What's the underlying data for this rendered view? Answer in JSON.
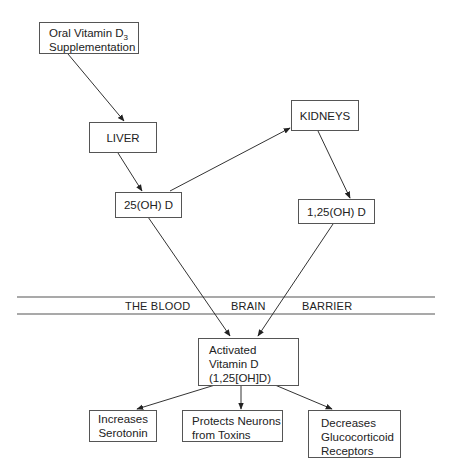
{
  "nodes": {
    "oral": {
      "line1": "Oral Vitamin D",
      "sub": "3",
      "line2": "Supplementation"
    },
    "liver": {
      "label": "LIVER"
    },
    "kidneys": {
      "label": "KIDNEYS"
    },
    "oh25": {
      "label": "25(OH) D"
    },
    "oh125": {
      "label": "1,25(OH) D"
    },
    "activated": {
      "line1": "Activated",
      "line2": "Vitamin D",
      "line3": "(1,25[OH]D)"
    },
    "serotonin": {
      "line1": "Increases",
      "line2": "Serotonin"
    },
    "neurons": {
      "line1": "Protects Neurons",
      "line2": "from Toxins"
    },
    "glucocorticoid": {
      "line1": "Decreases",
      "line2": "Glucocorticoid",
      "line3": "Receptors"
    }
  },
  "barrier": {
    "word1": "THE BLOOD",
    "word2": "BRAIN",
    "word3": "BARRIER"
  },
  "edges": [
    {
      "from": "oral",
      "to": "liver"
    },
    {
      "from": "liver",
      "to": "oh25"
    },
    {
      "from": "oh25",
      "to": "kidneys"
    },
    {
      "from": "kidneys",
      "to": "oh125"
    },
    {
      "from": "oh25",
      "to": "activated"
    },
    {
      "from": "oh125",
      "to": "activated"
    },
    {
      "from": "activated",
      "to": "serotonin"
    },
    {
      "from": "activated",
      "to": "neurons"
    },
    {
      "from": "activated",
      "to": "glucocorticoid"
    }
  ],
  "colors": {
    "line": "#333333",
    "border": "#555555",
    "background": "#ffffff"
  }
}
